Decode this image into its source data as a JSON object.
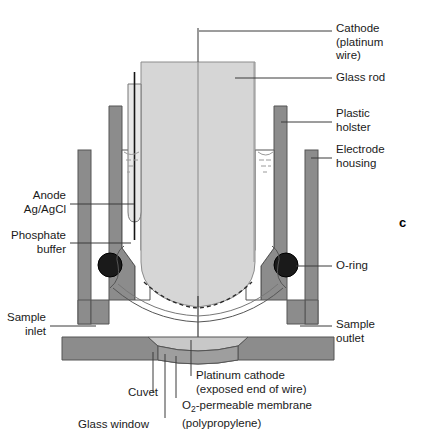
{
  "figure": {
    "panel_letter": "c",
    "title_implied": "Clark oxygen electrode assembly"
  },
  "colors": {
    "glass_rod_fill": "#d6d6d6",
    "housing_fill": "#8c8c8c",
    "cuvet_dark_fill": "#8c8c8c",
    "glass_window_fill": "#c8c8c8",
    "oring_fill": "#1a1a1a",
    "outline": "#555555",
    "leader_line": "#3a3a3a",
    "text": "#1a1a1a",
    "background": "#ffffff"
  },
  "labels": {
    "cathode": {
      "text": "Cathode\n(platinum\nwire)",
      "side": "right"
    },
    "glass_rod": {
      "text": "Glass rod",
      "side": "right"
    },
    "plastic_holster": {
      "text": "Plastic\nholster",
      "side": "right"
    },
    "electrode_housing": {
      "text": "Electrode\nhousing",
      "side": "right"
    },
    "o_ring": {
      "text": "O-ring",
      "side": "right"
    },
    "sample_outlet": {
      "text": "Sample\noutlet",
      "side": "right"
    },
    "anode": {
      "text": "Anode\nAg/AgCl",
      "side": "left"
    },
    "phosphate_buffer": {
      "text": "Phosphate\nbuffer",
      "side": "left"
    },
    "sample_inlet": {
      "text": "Sample\ninlet",
      "side": "left"
    },
    "platinum_cathode": {
      "text": "Platinum cathode\n(exposed end of wire)",
      "side": "bottom"
    },
    "cuvet": {
      "text": "Cuvet",
      "side": "bottom"
    },
    "o2_membrane_line1_pre": "O",
    "o2_membrane_line1_sub": "2",
    "o2_membrane_line1_post": "-permeable membrane",
    "o2_membrane_line2": "(polypropylene)",
    "glass_window": {
      "text": "Glass window",
      "side": "bottom"
    }
  }
}
